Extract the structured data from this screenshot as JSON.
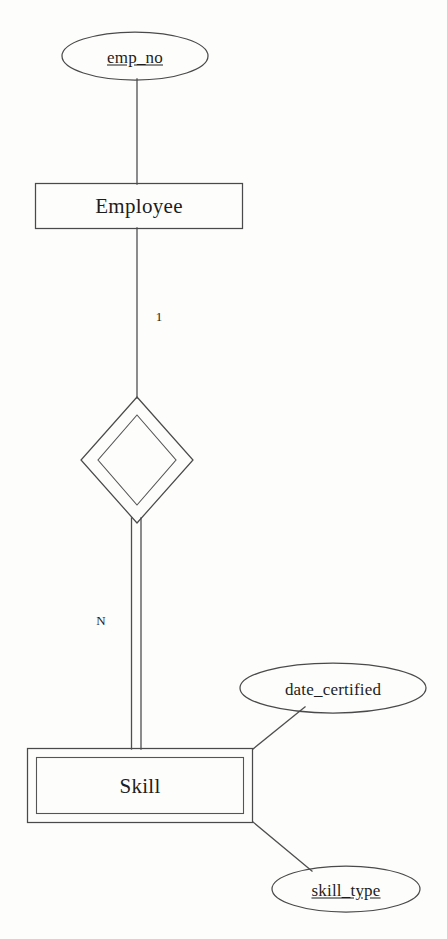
{
  "diagram": {
    "type": "entity-relationship-diagram",
    "notation": "chen",
    "background_color": "#fdfdfc",
    "line_color": "#4a4a4a",
    "text_color": "#1d1d1d",
    "entities": [
      {
        "id": "employee",
        "label": "Employee",
        "kind": "strong-entity",
        "border": "single"
      },
      {
        "id": "skill",
        "label": "Skill",
        "kind": "weak-entity",
        "border": "double"
      }
    ],
    "relationships": [
      {
        "id": "employee-skill-relationship",
        "label": "",
        "kind": "identifying-relationship",
        "border": "double"
      }
    ],
    "attributes": [
      {
        "id": "emp-no",
        "label": "emp_no",
        "kind": "key-attribute",
        "underlined": true,
        "owner": "employee"
      },
      {
        "id": "date-certified",
        "label": "date_certified",
        "kind": "attribute",
        "underlined": false,
        "owner": "skill"
      },
      {
        "id": "skill-type",
        "label": "skill_type",
        "kind": "partial-key-attribute",
        "underlined": true,
        "owner": "skill"
      }
    ],
    "cardinalities": [
      {
        "id": "cardinality-one",
        "label": "1",
        "side": "employee"
      },
      {
        "id": "cardinality-many",
        "label": "N",
        "side": "skill"
      }
    ],
    "connectors": [
      {
        "id": "emp-no-to-employee",
        "style": "single"
      },
      {
        "id": "employee-to-relationship",
        "style": "single"
      },
      {
        "id": "relationship-to-skill",
        "style": "double"
      },
      {
        "id": "skill-to-date-certified",
        "style": "single"
      },
      {
        "id": "skill-to-skill-type",
        "style": "single"
      }
    ]
  }
}
